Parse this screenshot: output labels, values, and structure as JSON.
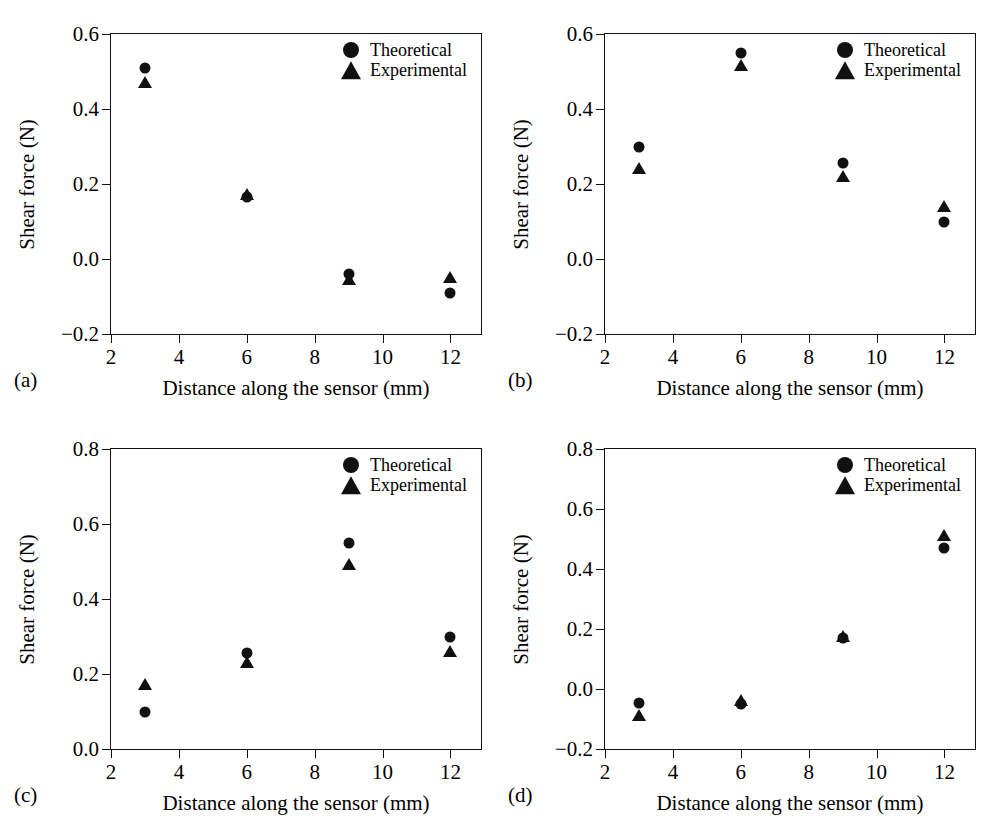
{
  "figure": {
    "background_color": "#ffffff",
    "marker_color": "#111111",
    "axis_color": "#111111",
    "series_names": [
      "Theoretical",
      "Experimental"
    ]
  },
  "panels": [
    {
      "caption": "(a)",
      "xlabel": "Distance along the sensor (mm)",
      "ylabel": "Shear force (N)",
      "xticks": [
        "2",
        "4",
        "6",
        "8",
        "10",
        "12"
      ],
      "yticks": [
        "-0.2",
        "0.0",
        "0.2",
        "0.4",
        "0.6"
      ],
      "legend": {
        "theoretical": "Theoretical",
        "experimental": "Experimental"
      }
    },
    {
      "caption": "(b)",
      "xlabel": "Distance along the sensor (mm)",
      "ylabel": "Shear force (N)",
      "xticks": [
        "2",
        "4",
        "6",
        "8",
        "10",
        "12"
      ],
      "yticks": [
        "-0.2",
        "0.0",
        "0.2",
        "0.4",
        "0.6"
      ],
      "legend": {
        "theoretical": "Theoretical",
        "experimental": "Experimental"
      }
    },
    {
      "caption": "(c)",
      "xlabel": "Distance along the sensor (mm)",
      "ylabel": "Shear force (N)",
      "xticks": [
        "2",
        "4",
        "6",
        "8",
        "10",
        "12"
      ],
      "yticks": [
        "0.0",
        "0.2",
        "0.4",
        "0.6",
        "0.8"
      ],
      "legend": {
        "theoretical": "Theoretical",
        "experimental": "Experimental"
      }
    },
    {
      "caption": "(d)",
      "xlabel": "Distance along the sensor (mm)",
      "ylabel": "Shear force (N)",
      "xticks": [
        "2",
        "4",
        "6",
        "8",
        "10",
        "12"
      ],
      "yticks": [
        "-0.2",
        "0.0",
        "0.2",
        "0.4",
        "0.6",
        "0.8"
      ],
      "legend": {
        "theoretical": "Theoretical",
        "experimental": "Experimental"
      }
    }
  ],
  "chart_data": [
    {
      "type": "scatter",
      "panel": "(a)",
      "title": "",
      "xlabel": "Distance along the sensor (mm)",
      "ylabel": "Shear force (N)",
      "x": [
        3,
        6,
        9,
        12
      ],
      "xlim": [
        2,
        12.9
      ],
      "ylim": [
        -0.2,
        0.6
      ],
      "xticks": [
        2,
        4,
        6,
        8,
        10,
        12
      ],
      "yticks": [
        -0.2,
        0.0,
        0.2,
        0.4,
        0.6
      ],
      "grid": false,
      "legend_position": "top-right",
      "series": [
        {
          "name": "Theoretical",
          "marker": "circle",
          "values": [
            0.51,
            0.165,
            -0.04,
            -0.09
          ]
        },
        {
          "name": "Experimental",
          "marker": "triangle",
          "values": [
            0.47,
            0.17,
            -0.055,
            -0.05
          ]
        }
      ]
    },
    {
      "type": "scatter",
      "panel": "(b)",
      "title": "",
      "xlabel": "Distance along the sensor (mm)",
      "ylabel": "Shear force (N)",
      "x": [
        3,
        6,
        9,
        12
      ],
      "xlim": [
        2,
        12.9
      ],
      "ylim": [
        -0.2,
        0.6
      ],
      "xticks": [
        2,
        4,
        6,
        8,
        10,
        12
      ],
      "yticks": [
        -0.2,
        0.0,
        0.2,
        0.4,
        0.6
      ],
      "grid": false,
      "legend_position": "top-right",
      "series": [
        {
          "name": "Theoretical",
          "marker": "circle",
          "values": [
            0.3,
            0.55,
            0.255,
            0.1
          ]
        },
        {
          "name": "Experimental",
          "marker": "triangle",
          "values": [
            0.24,
            0.515,
            0.22,
            0.14
          ]
        }
      ]
    },
    {
      "type": "scatter",
      "panel": "(c)",
      "title": "",
      "xlabel": "Distance along the sensor (mm)",
      "ylabel": "Shear force (N)",
      "x": [
        3,
        6,
        9,
        12
      ],
      "xlim": [
        2,
        12.9
      ],
      "ylim": [
        0.0,
        0.8
      ],
      "xticks": [
        2,
        4,
        6,
        8,
        10,
        12
      ],
      "yticks": [
        0.0,
        0.2,
        0.4,
        0.6,
        0.8
      ],
      "grid": false,
      "legend_position": "top-right",
      "series": [
        {
          "name": "Theoretical",
          "marker": "circle",
          "values": [
            0.1,
            0.255,
            0.55,
            0.3
          ]
        },
        {
          "name": "Experimental",
          "marker": "triangle",
          "values": [
            0.17,
            0.23,
            0.49,
            0.26
          ]
        }
      ]
    },
    {
      "type": "scatter",
      "panel": "(d)",
      "title": "",
      "xlabel": "Distance along the sensor (mm)",
      "ylabel": "Shear force (N)",
      "x": [
        3,
        6,
        9,
        12
      ],
      "xlim": [
        2,
        12.9
      ],
      "ylim": [
        -0.2,
        0.8
      ],
      "xticks": [
        2,
        4,
        6,
        8,
        10,
        12
      ],
      "yticks": [
        -0.2,
        0.0,
        0.2,
        0.4,
        0.6,
        0.8
      ],
      "grid": false,
      "legend_position": "top-right",
      "series": [
        {
          "name": "Theoretical",
          "marker": "circle",
          "values": [
            -0.045,
            -0.05,
            0.17,
            0.47
          ]
        },
        {
          "name": "Experimental",
          "marker": "triangle",
          "values": [
            -0.09,
            -0.04,
            0.175,
            0.51
          ]
        }
      ]
    }
  ]
}
